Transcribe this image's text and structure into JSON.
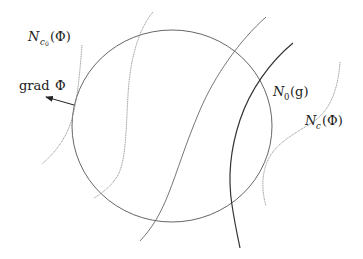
{
  "diagram": {
    "labels": {
      "n_c0": {
        "main": "N",
        "sub": "c",
        "subsub": "0",
        "arg": "(Φ)"
      },
      "grad": {
        "text": "grad",
        "symbol": "Φ"
      },
      "n_0": {
        "main": "N",
        "sub": "0",
        "arg": "(g)"
      },
      "n_c": {
        "main": "N",
        "sub": "c",
        "arg": "(Φ)"
      }
    },
    "colors": {
      "circle": "#555555",
      "curve": "#666666",
      "curve_dark": "#333333",
      "text": "#222222"
    },
    "elements": [
      "circle",
      "level-curve-N_c0(Φ)",
      "level-curve-2",
      "level-curve-3",
      "curve-N_0(g)",
      "level-curve-N_c(Φ)",
      "arrow-grad-Φ"
    ]
  }
}
